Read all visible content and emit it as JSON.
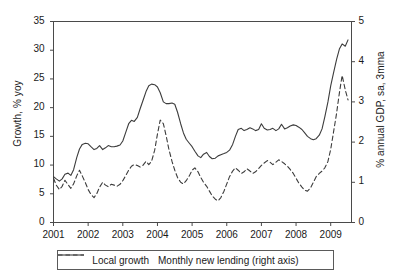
{
  "chart_data": {
    "type": "line",
    "title": "",
    "xlabel": "",
    "ylabel": "Growth, % yoy",
    "y2label": "% annual GDP, sa, 3mma",
    "xlim": [
      2001,
      2009.6
    ],
    "ylim": [
      0,
      35
    ],
    "y2lim": [
      0,
      5
    ],
    "grid": false,
    "legend_position": "bottom",
    "x_ticks": [
      "2001",
      "2002",
      "2003",
      "2004",
      "2005",
      "2006",
      "2007",
      "2008",
      "2009"
    ],
    "y_ticks_left": [
      "0",
      "5",
      "10",
      "15",
      "20",
      "25",
      "30",
      "35"
    ],
    "y_ticks_right": [
      "0",
      "1",
      "2",
      "3",
      "4",
      "5"
    ],
    "series": [
      {
        "name": "Local growth",
        "axis": "left",
        "style": "solid",
        "color": "#3c3c3c",
        "x": [
          2001.0,
          2001.08,
          2001.17,
          2001.25,
          2001.33,
          2001.42,
          2001.5,
          2001.58,
          2001.67,
          2001.75,
          2001.83,
          2001.92,
          2002.0,
          2002.08,
          2002.17,
          2002.25,
          2002.33,
          2002.42,
          2002.5,
          2002.58,
          2002.67,
          2002.75,
          2002.83,
          2002.92,
          2003.0,
          2003.08,
          2003.17,
          2003.25,
          2003.33,
          2003.42,
          2003.5,
          2003.58,
          2003.67,
          2003.75,
          2003.83,
          2003.92,
          2004.0,
          2004.08,
          2004.17,
          2004.25,
          2004.33,
          2004.42,
          2004.5,
          2004.58,
          2004.67,
          2004.75,
          2004.83,
          2004.92,
          2005.0,
          2005.08,
          2005.17,
          2005.25,
          2005.33,
          2005.42,
          2005.5,
          2005.58,
          2005.67,
          2005.75,
          2005.83,
          2005.92,
          2006.0,
          2006.08,
          2006.17,
          2006.25,
          2006.33,
          2006.42,
          2006.5,
          2006.58,
          2006.67,
          2006.75,
          2006.83,
          2006.92,
          2007.0,
          2007.08,
          2007.17,
          2007.25,
          2007.33,
          2007.42,
          2007.5,
          2007.58,
          2007.67,
          2007.75,
          2007.83,
          2007.92,
          2008.0,
          2008.08,
          2008.17,
          2008.25,
          2008.33,
          2008.42,
          2008.5,
          2008.58,
          2008.67,
          2008.75,
          2008.83,
          2008.92,
          2009.0,
          2009.08,
          2009.17,
          2009.25,
          2009.33,
          2009.42,
          2009.5
        ],
        "values": [
          8.0,
          7.6,
          7.2,
          7.6,
          8.4,
          8.6,
          8.2,
          9.2,
          11.3,
          12.8,
          13.6,
          13.8,
          13.7,
          13.2,
          12.7,
          12.9,
          13.4,
          12.7,
          13.0,
          13.4,
          13.2,
          13.2,
          13.3,
          13.5,
          14.2,
          15.6,
          17.2,
          17.8,
          17.6,
          18.3,
          19.8,
          21.2,
          22.8,
          23.8,
          24.1,
          24.0,
          23.6,
          22.6,
          21.0,
          20.7,
          20.7,
          20.8,
          20.6,
          19.2,
          17.2,
          15.6,
          14.5,
          13.8,
          13.2,
          12.4,
          11.6,
          11.3,
          11.9,
          12.2,
          11.5,
          11.1,
          11.2,
          11.6,
          11.8,
          12.0,
          12.2,
          12.6,
          13.6,
          15.0,
          16.2,
          16.4,
          16.0,
          16.2,
          16.5,
          16.3,
          16.0,
          16.2,
          17.2,
          16.4,
          16.1,
          16.2,
          16.4,
          16.0,
          16.3,
          17.1,
          16.3,
          16.5,
          16.8,
          17.0,
          16.9,
          16.6,
          16.2,
          15.6,
          15.0,
          14.6,
          14.4,
          14.6,
          15.2,
          16.3,
          18.4,
          21.0,
          23.8,
          26.0,
          28.4,
          30.2,
          31.1,
          30.7,
          31.8
        ]
      },
      {
        "name": "Monthly new lending (right axis)",
        "axis": "right",
        "style": "dashed",
        "color": "#3c3c3c",
        "x": [
          2001.0,
          2001.08,
          2001.17,
          2001.25,
          2001.33,
          2001.42,
          2001.5,
          2001.58,
          2001.67,
          2001.75,
          2001.83,
          2001.92,
          2002.0,
          2002.08,
          2002.17,
          2002.25,
          2002.33,
          2002.42,
          2002.5,
          2002.58,
          2002.67,
          2002.75,
          2002.83,
          2002.92,
          2003.0,
          2003.08,
          2003.17,
          2003.25,
          2003.33,
          2003.42,
          2003.5,
          2003.58,
          2003.67,
          2003.75,
          2003.83,
          2003.92,
          2004.0,
          2004.08,
          2004.17,
          2004.25,
          2004.33,
          2004.42,
          2004.5,
          2004.58,
          2004.67,
          2004.75,
          2004.83,
          2004.92,
          2005.0,
          2005.08,
          2005.17,
          2005.25,
          2005.33,
          2005.42,
          2005.5,
          2005.58,
          2005.67,
          2005.75,
          2005.83,
          2005.92,
          2006.0,
          2006.08,
          2006.17,
          2006.25,
          2006.33,
          2006.42,
          2006.5,
          2006.58,
          2006.67,
          2006.75,
          2006.83,
          2006.92,
          2007.0,
          2007.08,
          2007.17,
          2007.25,
          2007.33,
          2007.42,
          2007.5,
          2007.58,
          2007.67,
          2007.75,
          2007.83,
          2007.92,
          2008.0,
          2008.08,
          2008.17,
          2008.25,
          2008.33,
          2008.42,
          2008.5,
          2008.58,
          2008.67,
          2008.75,
          2008.83,
          2008.92,
          2009.0,
          2009.08,
          2009.17,
          2009.25,
          2009.33,
          2009.42,
          2009.5
        ],
        "values": [
          1.1,
          0.93,
          0.82,
          0.9,
          1.05,
          0.94,
          0.85,
          0.96,
          1.16,
          1.3,
          1.16,
          0.99,
          0.82,
          0.7,
          0.62,
          0.72,
          0.88,
          1.0,
          0.93,
          0.89,
          0.95,
          0.93,
          0.9,
          0.95,
          1.04,
          1.16,
          1.3,
          1.4,
          1.44,
          1.42,
          1.38,
          1.42,
          1.52,
          1.44,
          1.52,
          1.8,
          2.2,
          2.55,
          2.46,
          2.16,
          1.82,
          1.52,
          1.3,
          1.12,
          1.0,
          0.96,
          1.04,
          1.16,
          1.3,
          1.36,
          1.26,
          1.12,
          1.0,
          0.9,
          0.78,
          0.66,
          0.58,
          0.54,
          0.62,
          0.78,
          0.96,
          1.14,
          1.28,
          1.36,
          1.3,
          1.22,
          1.26,
          1.34,
          1.28,
          1.22,
          1.26,
          1.34,
          1.42,
          1.48,
          1.54,
          1.5,
          1.44,
          1.5,
          1.56,
          1.52,
          1.46,
          1.4,
          1.32,
          1.22,
          1.1,
          0.98,
          0.88,
          0.8,
          0.78,
          0.86,
          1.0,
          1.14,
          1.22,
          1.28,
          1.36,
          1.52,
          1.82,
          2.24,
          2.72,
          3.22,
          3.66,
          3.3,
          3.05
        ]
      }
    ]
  },
  "axes": {
    "left_title": "Growth, % yoy",
    "right_title": "% annual GDP, sa, 3mma"
  },
  "legend": {
    "items": [
      {
        "label": "Local growth",
        "style": "solid"
      },
      {
        "label": "Monthly new lending (right axis)",
        "style": "dashed"
      }
    ]
  }
}
